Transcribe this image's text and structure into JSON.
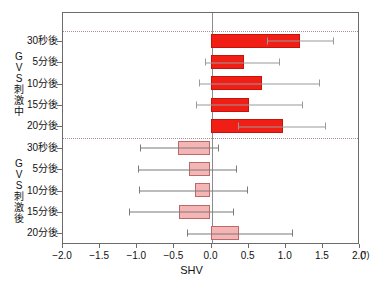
{
  "chart_data": {
    "type": "bar",
    "orientation": "horizontal",
    "title": "",
    "xlabel": "SHV",
    "ylabel": "",
    "x_unit": "(°)",
    "xlim": [
      -2.0,
      2.0
    ],
    "xticks": [
      -2.0,
      -1.5,
      -1.0,
      -0.5,
      0.0,
      0.5,
      1.0,
      1.5,
      2.0
    ],
    "xtick_labels": [
      "−2.0",
      "−1.5",
      "−1.0",
      "−0.5",
      "0.0",
      "0.5",
      "1.0",
      "1.5",
      "2.0"
    ],
    "grid": false,
    "zero_line": true,
    "legend": "none",
    "error_bars": "standard deviation",
    "groups": [
      {
        "name": "GVS刺激中",
        "name_chars": [
          "G",
          "V",
          "S",
          "刺",
          "激",
          "中"
        ],
        "color": "#f01e14",
        "categories": [
          "30秒後",
          "5分後",
          "10分後",
          "15分後",
          "20分後"
        ],
        "values": [
          1.21,
          0.45,
          0.69,
          0.52,
          0.97
        ],
        "err_low": [
          0.76,
          -0.07,
          -0.15,
          -0.2,
          0.37
        ],
        "err_high": [
          1.66,
          0.93,
          1.48,
          1.24,
          1.56
        ]
      },
      {
        "name": "GVS刺激後",
        "name_chars": [
          "G",
          "V",
          "S",
          "刺",
          "激",
          "後"
        ],
        "color": "#f5b5b5",
        "categories": [
          "30秒後",
          "5分後",
          "10分後",
          "15分後",
          "20分後"
        ],
        "values": [
          -0.44,
          -0.29,
          -0.21,
          -0.42,
          0.39
        ],
        "err_low": [
          -0.95,
          -0.97,
          -0.96,
          -1.1,
          -0.32
        ],
        "err_high": [
          0.12,
          0.36,
          0.51,
          0.31,
          1.11
        ]
      }
    ]
  },
  "colors": {
    "bar_during": "#f01e14",
    "bar_during_edge": "#c4140c",
    "bar_after": "#f5b5b5",
    "bar_after_edge": "#b96a6a",
    "axis": "#6b6b6b",
    "error": "#7a7a7a",
    "separator": "#b08c8c",
    "background": "#ffffff"
  }
}
